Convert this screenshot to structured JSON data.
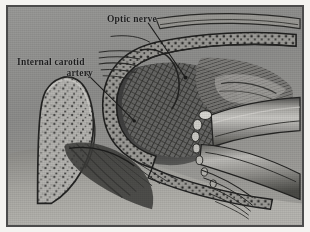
{
  "figure": {
    "kind": "anatomical-illustration",
    "style": "grayscale halftone line-and-stipple surgical drawing",
    "frame": {
      "border_color": "#4b4b4b",
      "paper_color": "#f4f3f0",
      "plate_background": "#8e8e8e"
    }
  },
  "labels": [
    {
      "id": "optic-nerve",
      "text": "Optic nerve",
      "lines": [
        "Optic nerve"
      ],
      "x": 99,
      "y": 7,
      "leader": {
        "from_x": 152,
        "from_y": 22,
        "to_x": 190,
        "to_y": 79
      }
    },
    {
      "id": "internal-carotid-artery",
      "text": "Internal carotid artery",
      "lines": [
        "Internal carotid",
        "artery"
      ],
      "x": 9,
      "y": 50,
      "leader": {
        "from_x": 88,
        "from_y": 73,
        "to_x": 137,
        "to_y": 122
      }
    }
  ],
  "structures": [
    {
      "name": "anterior-clinoid-process-bone",
      "texture": "stippled cancellous bone",
      "region": "left"
    },
    {
      "name": "dural-fold-band",
      "texture": "dark stippled band",
      "region": "center"
    },
    {
      "name": "optic-nerve-sheath",
      "texture": "hatched",
      "region": "upper-center"
    },
    {
      "name": "internal-carotid-artery-trunk",
      "texture": "smooth shaded tube",
      "region": "right"
    },
    {
      "name": "cavernous-sinus-wall",
      "texture": "dense cross-hatch",
      "region": "center-right"
    },
    {
      "name": "sphenoid-sinus-mucosa",
      "texture": "radiating hatch",
      "region": "lower-center"
    }
  ],
  "colors": {
    "ink": "#1d1d1d",
    "mid_gray": "#8e8e8e",
    "dark_gray": "#3a3a3a",
    "light_gray": "#b9b8b4",
    "highlight": "#d6d5d1"
  }
}
